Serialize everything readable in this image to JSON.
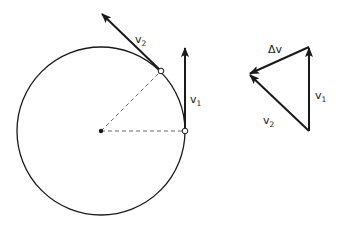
{
  "diagram": {
    "colors": {
      "ink": "#1a1a1a",
      "background": "#ffffff",
      "dashed": "#555555"
    },
    "circle": {
      "cx": 101,
      "cy": 131,
      "r": 84
    },
    "center_point": {
      "x": 101,
      "y": 131
    },
    "points": [
      {
        "name": "point-1",
        "x": 185,
        "y": 131
      },
      {
        "name": "point-2",
        "x": 161,
        "y": 71
      }
    ],
    "radii": [
      {
        "from": [
          101,
          131
        ],
        "to": [
          185,
          131
        ]
      },
      {
        "from": [
          101,
          131
        ],
        "to": [
          161,
          71
        ]
      }
    ],
    "vectors": {
      "v1": {
        "from": [
          185,
          131
        ],
        "to": [
          185,
          48
        ]
      },
      "v2": {
        "from": [
          161,
          71
        ],
        "to": [
          102,
          14
        ]
      }
    },
    "labels": {
      "v1": {
        "main": "v",
        "sub": "1"
      },
      "v2": {
        "main": "v",
        "sub": "2"
      }
    },
    "triangle": {
      "vertices": {
        "top": [
          309,
          47
        ],
        "bottom": [
          309,
          131
        ],
        "left": [
          249,
          74
        ]
      },
      "v1": {
        "from": [
          309,
          131
        ],
        "to": [
          309,
          47
        ]
      },
      "v2": {
        "from": [
          309,
          131
        ],
        "to": [
          249,
          74
        ]
      },
      "dv": {
        "from": [
          309,
          47
        ],
        "to": [
          249,
          74
        ]
      },
      "labels": {
        "dv": "Δv",
        "v1": {
          "main": "v",
          "sub": "1"
        },
        "v2": {
          "main": "v",
          "sub": "2"
        }
      }
    }
  }
}
